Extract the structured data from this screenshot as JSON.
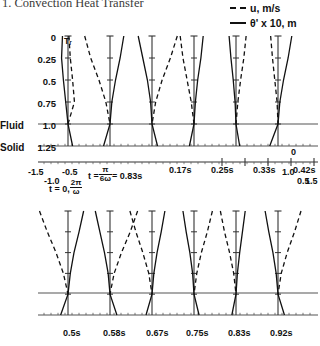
{
  "page": {
    "title": "1.  Convection Heat Transfer"
  },
  "legend": {
    "position": "top-right",
    "entries": [
      {
        "key": "dashed",
        "label": "u, m/s",
        "name": "legend-velocity"
      },
      {
        "key": "solid",
        "label": "θ' x 10, m",
        "name": "legend-temperature"
      }
    ]
  },
  "axes": {
    "y_label_values": [
      "0",
      "0.25",
      "0.5",
      "0.75",
      "1.0",
      "1.25"
    ],
    "y_values": [
      0,
      0.25,
      0.5,
      0.75,
      1.0,
      1.25
    ],
    "region_labels": {
      "fluid": "Fluid",
      "solid": "Solid"
    },
    "interface_y": 1.0,
    "baseline_y": 1.25,
    "profile_axis_label": "Tᵣ",
    "scale_ticks_upper": [
      "0"
    ],
    "scale_ticks_left": [
      "-1.5",
      "-1.0",
      "-0.5"
    ],
    "scale_ticks_right": [
      "0.5",
      "1.0",
      "1.5"
    ],
    "scale_range": [
      -1.5,
      1.5
    ],
    "scale_tick_values": [
      -1.5,
      -1.0,
      -0.5,
      0,
      0.5,
      1.0,
      1.5
    ]
  },
  "annotations": {
    "t_zero": {
      "prefix": "t = 0,",
      "num": "2π",
      "den": "ω"
    },
    "t_first": {
      "prefix": "t =",
      "num": "π",
      "den": "6ω",
      "suffix": "= 0.83s"
    }
  },
  "chart_data": {
    "type": "line",
    "title": "1.  Convection Heat Transfer",
    "xlabel": "u, m/s   and   θ' x 10, m",
    "ylabel": "y (distance), fluid 0–1.0, solid 1.0–1.25",
    "ylim": [
      0,
      1.25
    ],
    "xlim": [
      -1.5,
      1.5
    ],
    "grid": false,
    "legend_position": "top-right",
    "series_styles": {
      "u, m/s": "dashed",
      "θ' x 10, m": "solid"
    },
    "panels": [
      {
        "row": "top",
        "time_labels": [
          "t = 0, 2π/ω",
          "t = π/6ω = 0.83s",
          "0.17s",
          "0.25s",
          "0.33s",
          "0.42s"
        ],
        "time_values_s": [
          0,
          0.083,
          0.17,
          0.25,
          0.33,
          0.42
        ],
        "frames": [
          {
            "label": "t = 0, 2π/ω",
            "u": [
              {
                "y": 0,
                "x": 0.02
              },
              {
                "y": 0.25,
                "x": 0.05
              },
              {
                "y": 0.5,
                "x": 0.1
              },
              {
                "y": 0.75,
                "x": 0.14
              },
              {
                "y": 1.0,
                "x": 0.0
              }
            ],
            "theta": [
              {
                "y": 0,
                "x": -0.12
              },
              {
                "y": 0.25,
                "x": -0.14
              },
              {
                "y": 0.5,
                "x": -0.1
              },
              {
                "y": 0.75,
                "x": -0.05
              },
              {
                "y": 1.0,
                "x": 0.0
              },
              {
                "y": 1.25,
                "x": 0.1
              }
            ]
          },
          {
            "label": "t = π/6ω = 0.83s",
            "u": [
              {
                "y": 0,
                "x": -0.55
              },
              {
                "y": 0.25,
                "x": -0.42
              },
              {
                "y": 0.5,
                "x": -0.24
              },
              {
                "y": 0.75,
                "x": -0.09
              },
              {
                "y": 1.0,
                "x": 0.0
              }
            ],
            "theta": [
              {
                "y": 0,
                "x": 0.3
              },
              {
                "y": 0.25,
                "x": 0.22
              },
              {
                "y": 0.5,
                "x": 0.12
              },
              {
                "y": 0.75,
                "x": 0.04
              },
              {
                "y": 1.0,
                "x": 0.0
              },
              {
                "y": 1.25,
                "x": -0.14
              }
            ]
          },
          {
            "label": "0.17s",
            "u": [
              {
                "y": 0,
                "x": 0.55
              },
              {
                "y": 0.25,
                "x": 0.4
              },
              {
                "y": 0.5,
                "x": 0.22
              },
              {
                "y": 0.75,
                "x": 0.08
              },
              {
                "y": 1.0,
                "x": 0.0
              }
            ],
            "theta": [
              {
                "y": 0,
                "x": -0.3
              },
              {
                "y": 0.25,
                "x": -0.2
              },
              {
                "y": 0.5,
                "x": -0.1
              },
              {
                "y": 0.75,
                "x": -0.03
              },
              {
                "y": 1.0,
                "x": 0.0
              },
              {
                "y": 1.25,
                "x": 0.12
              }
            ]
          },
          {
            "label": "0.25s",
            "u": [
              {
                "y": 0,
                "x": -0.3
              },
              {
                "y": 0.25,
                "x": -0.24
              },
              {
                "y": 0.5,
                "x": -0.15
              },
              {
                "y": 0.75,
                "x": -0.06
              },
              {
                "y": 1.0,
                "x": 0.0
              }
            ],
            "theta": [
              {
                "y": 0,
                "x": 0.2
              },
              {
                "y": 0.25,
                "x": 0.15
              },
              {
                "y": 0.5,
                "x": 0.08
              },
              {
                "y": 0.75,
                "x": 0.03
              },
              {
                "y": 1.0,
                "x": 0.0
              },
              {
                "y": 1.25,
                "x": -0.1
              }
            ]
          },
          {
            "label": "0.33s",
            "u": [
              {
                "y": 0,
                "x": 0.22
              },
              {
                "y": 0.25,
                "x": 0.17
              },
              {
                "y": 0.5,
                "x": 0.1
              },
              {
                "y": 0.75,
                "x": 0.04
              },
              {
                "y": 1.0,
                "x": 0.0
              }
            ],
            "theta": [
              {
                "y": 0,
                "x": -0.15
              },
              {
                "y": 0.25,
                "x": -0.11
              },
              {
                "y": 0.5,
                "x": -0.06
              },
              {
                "y": 0.75,
                "x": -0.02
              },
              {
                "y": 1.0,
                "x": 0.0
              },
              {
                "y": 1.25,
                "x": 0.08
              }
            ]
          },
          {
            "label": "0.42s",
            "u": [
              {
                "y": 0,
                "x": -0.16
              },
              {
                "y": 0.25,
                "x": -0.12
              },
              {
                "y": 0.5,
                "x": -0.07
              },
              {
                "y": 0.75,
                "x": -0.02
              },
              {
                "y": 1.0,
                "x": 0.0
              }
            ],
            "theta": [
              {
                "y": 0,
                "x": 0.3
              },
              {
                "y": 0.25,
                "x": 0.22
              },
              {
                "y": 0.5,
                "x": 0.12
              },
              {
                "y": 0.75,
                "x": 0.04
              },
              {
                "y": 1.0,
                "x": 0.0
              },
              {
                "y": 1.25,
                "x": -0.18
              }
            ]
          }
        ]
      },
      {
        "row": "bottom",
        "time_labels": [
          "0.5s",
          "0.58s",
          "0.67s",
          "0.75s",
          "0.83s",
          "0.92s"
        ],
        "time_values_s": [
          0.5,
          0.58,
          0.67,
          0.75,
          0.83,
          0.92
        ],
        "frames": [
          {
            "label": "0.5s",
            "u": [
              {
                "y": 0,
                "x": -0.62
              },
              {
                "y": 0.25,
                "x": -0.45
              },
              {
                "y": 0.5,
                "x": -0.26
              },
              {
                "y": 0.75,
                "x": -0.1
              },
              {
                "y": 1.0,
                "x": 0.0
              }
            ],
            "theta": [
              {
                "y": 0,
                "x": 0.34
              },
              {
                "y": 0.25,
                "x": 0.24
              },
              {
                "y": 0.5,
                "x": 0.13
              },
              {
                "y": 0.75,
                "x": 0.05
              },
              {
                "y": 1.0,
                "x": 0.0
              },
              {
                "y": 1.25,
                "x": -0.16
              }
            ]
          },
          {
            "label": "0.58s",
            "u": [
              {
                "y": 0,
                "x": 0.6
              },
              {
                "y": 0.25,
                "x": 0.44
              },
              {
                "y": 0.5,
                "x": 0.25
              },
              {
                "y": 0.75,
                "x": 0.09
              },
              {
                "y": 1.0,
                "x": 0.0
              }
            ],
            "theta": [
              {
                "y": 0,
                "x": -0.32
              },
              {
                "y": 0.25,
                "x": -0.22
              },
              {
                "y": 0.5,
                "x": -0.12
              },
              {
                "y": 0.75,
                "x": -0.04
              },
              {
                "y": 1.0,
                "x": 0.0
              },
              {
                "y": 1.25,
                "x": 0.15
              }
            ]
          },
          {
            "label": "0.67s",
            "u": [
              {
                "y": 0,
                "x": -0.48
              },
              {
                "y": 0.25,
                "x": -0.35
              },
              {
                "y": 0.5,
                "x": -0.2
              },
              {
                "y": 0.75,
                "x": -0.07
              },
              {
                "y": 1.0,
                "x": 0.0
              }
            ],
            "theta": [
              {
                "y": 0,
                "x": 0.28
              },
              {
                "y": 0.25,
                "x": 0.2
              },
              {
                "y": 0.5,
                "x": 0.11
              },
              {
                "y": 0.75,
                "x": 0.04
              },
              {
                "y": 1.0,
                "x": 0.0
              },
              {
                "y": 1.25,
                "x": -0.13
              }
            ]
          },
          {
            "label": "0.75s",
            "u": [
              {
                "y": 0,
                "x": 0.4
              },
              {
                "y": 0.25,
                "x": 0.29
              },
              {
                "y": 0.5,
                "x": 0.16
              },
              {
                "y": 0.75,
                "x": 0.06
              },
              {
                "y": 1.0,
                "x": 0.0
              }
            ],
            "theta": [
              {
                "y": 0,
                "x": -0.24
              },
              {
                "y": 0.25,
                "x": -0.17
              },
              {
                "y": 0.5,
                "x": -0.09
              },
              {
                "y": 0.75,
                "x": -0.03
              },
              {
                "y": 1.0,
                "x": 0.0
              },
              {
                "y": 1.25,
                "x": 0.11
              }
            ]
          },
          {
            "label": "0.83s",
            "u": [
              {
                "y": 0,
                "x": -0.34
              },
              {
                "y": 0.25,
                "x": -0.25
              },
              {
                "y": 0.5,
                "x": -0.14
              },
              {
                "y": 0.75,
                "x": -0.05
              },
              {
                "y": 1.0,
                "x": 0.0
              }
            ],
            "theta": [
              {
                "y": 0,
                "x": 0.2
              },
              {
                "y": 0.25,
                "x": 0.14
              },
              {
                "y": 0.5,
                "x": 0.08
              },
              {
                "y": 0.75,
                "x": 0.03
              },
              {
                "y": 1.0,
                "x": 0.0
              },
              {
                "y": 1.25,
                "x": -0.09
              }
            ]
          },
          {
            "label": "0.92s",
            "u": [
              {
                "y": 0,
                "x": 0.5
              },
              {
                "y": 0.25,
                "x": 0.36
              },
              {
                "y": 0.5,
                "x": 0.2
              },
              {
                "y": 0.75,
                "x": 0.07
              },
              {
                "y": 1.0,
                "x": 0.0
              }
            ],
            "theta": [
              {
                "y": 0,
                "x": -0.28
              },
              {
                "y": 0.25,
                "x": -0.2
              },
              {
                "y": 0.5,
                "x": -0.11
              },
              {
                "y": 0.75,
                "x": -0.04
              },
              {
                "y": 1.0,
                "x": 0.0
              },
              {
                "y": 1.25,
                "x": 0.14
              }
            ]
          }
        ]
      }
    ]
  }
}
